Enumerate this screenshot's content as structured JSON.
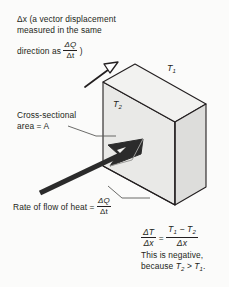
{
  "figure": {
    "type": "physics-diagram",
    "background_color": "#fbfbfa",
    "ink_color": "#231f20"
  },
  "solid": {
    "name": "rectangular-slab",
    "face_colors": {
      "front": "#e9e9e7",
      "top": "#f1f1ef",
      "right": "#dcdcda"
    },
    "front_face_label": "T",
    "front_face_subscript": "2",
    "back_top_label": "T",
    "back_top_subscript": "1"
  },
  "annotations": {
    "displacement_note": {
      "line1": "Δx (a vector displacement",
      "line2": "measured in the same",
      "line3_prefix": "direction as",
      "line3_fraction_numerator": "ΔQ",
      "line3_fraction_denominator": "Δt",
      "line3_suffix": ")"
    },
    "area_note": {
      "line1": "Cross-sectional",
      "line2": "area = A"
    },
    "heat_rate_note": {
      "label": "Rate of flow of heat =",
      "fraction_numerator": "ΔQ",
      "fraction_denominator": "Δt"
    },
    "temperature_labels": {
      "hot_side": "T",
      "hot_side_subscript": "1",
      "cold_side": "T",
      "cold_side_subscript": "2"
    },
    "gradient_equation": {
      "lhs_numerator": "ΔT",
      "lhs_denominator": "Δx",
      "equals": "=",
      "rhs_numerator_a": "T",
      "rhs_numerator_a_sub": "1",
      "rhs_minus": "−",
      "rhs_numerator_b": "T",
      "rhs_numerator_b_sub": "2",
      "rhs_denominator": "Δx",
      "note_line1": "This is negative,",
      "note_line2_prefix": "because",
      "note_line2_t2": "T",
      "note_line2_t2_sub": "2",
      "note_line2_gt": ">",
      "note_line2_t1": "T",
      "note_line2_t1_sub": "1",
      "note_line2_period": "."
    }
  },
  "arrows": {
    "displacement_arrow": {
      "name": "delta-x-arrow",
      "style": "thin-open-head",
      "direction": "up-right along top edge"
    },
    "heat_flow_arrow": {
      "name": "heat-flow-arrow",
      "style": "thick-solid-head",
      "direction": "up-right into front face"
    }
  },
  "leader_lines": {
    "area_leader": "from 'area = A' to front face",
    "rate_leader": "from heat-rate label to arrow tail"
  }
}
